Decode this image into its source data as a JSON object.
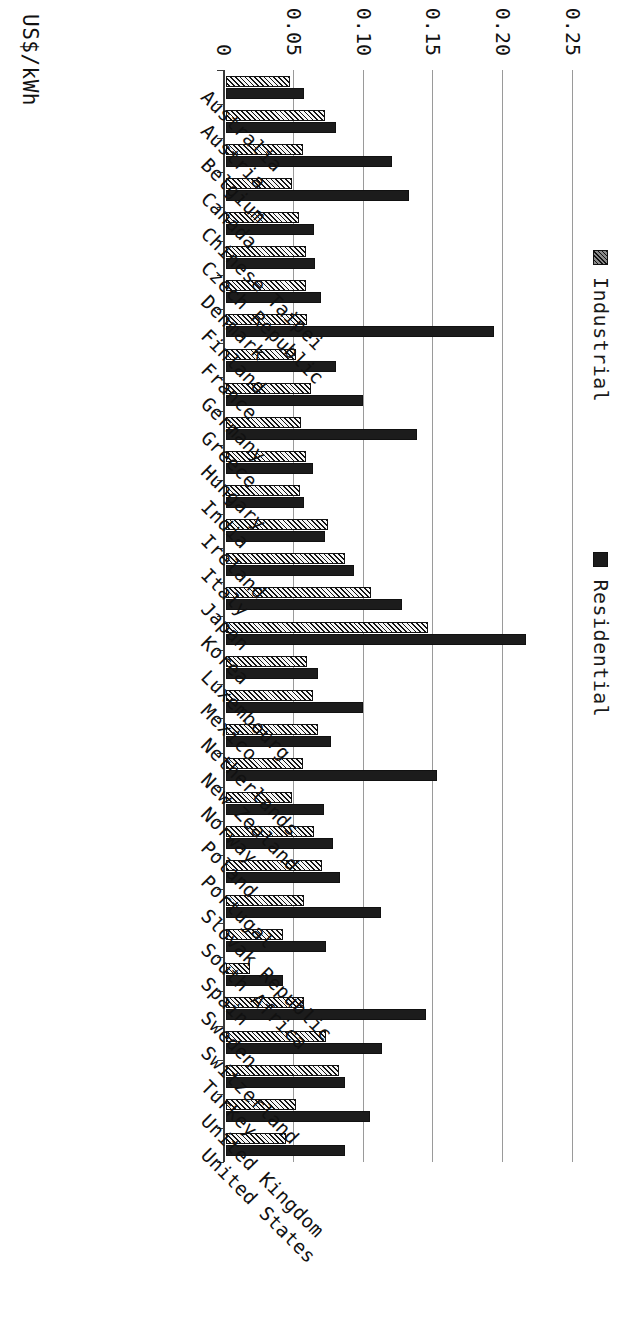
{
  "chart_data": {
    "type": "bar",
    "title": "",
    "subtitle": "",
    "orientation": "vertical-bars-rotated-90",
    "xlabel": "",
    "ylabel": "US$/kWh",
    "ylim": [
      0,
      0.25
    ],
    "yticks": [
      "0",
      "0.05",
      "0.10",
      "0.15",
      "0.20",
      "0.25"
    ],
    "ytick_values": [
      0,
      0.05,
      0.1,
      0.15,
      0.2,
      0.25
    ],
    "grid": true,
    "legend_position": "top",
    "categories": [
      "Australia",
      "Austria",
      "Belgium",
      "Canada",
      "Chinese Taipei",
      "Czech Republic",
      "Denmark",
      "Finland",
      "France",
      "Germany",
      "Greece",
      "Hungary",
      "India",
      "Ireland",
      "Italy",
      "Japan",
      "Korea",
      "Luxembourg",
      "Mexico",
      "Netherlands",
      "New Zealand",
      "Norway",
      "Poland",
      "Portugal",
      "Slovak Republic",
      "South Africa",
      "Spain",
      "Sweden",
      "Switzerland",
      "Turkey",
      "United Kingdom",
      "United States"
    ],
    "series": [
      {
        "name": "Industrial",
        "pattern": "hatched",
        "color": "#8f8f8f",
        "values": [
          0.046,
          0.071,
          0.055,
          0.047,
          0.052,
          0.057,
          0.057,
          0.058,
          0.05,
          0.061,
          0.054,
          0.057,
          0.053,
          0.073,
          0.085,
          0.104,
          0.145,
          0.058,
          0.062,
          0.066,
          0.055,
          0.047,
          0.063,
          0.069,
          0.056,
          0.041,
          0.017,
          0.056,
          0.072,
          0.081,
          0.05,
          0.043
        ]
      },
      {
        "name": "Residential",
        "pattern": "solid",
        "color": "#1c1c1c",
        "values": [
          0.056,
          0.079,
          0.119,
          0.131,
          0.063,
          0.064,
          0.068,
          0.192,
          0.079,
          0.098,
          0.137,
          0.062,
          0.056,
          0.071,
          0.092,
          0.126,
          0.215,
          0.066,
          0.098,
          0.075,
          0.151,
          0.07,
          0.077,
          0.082,
          0.111,
          0.072,
          0.041,
          0.143,
          0.112,
          0.085,
          0.103,
          0.085
        ]
      }
    ]
  },
  "legend": {
    "items": [
      {
        "label": "Industrial",
        "swatch": "hatched-swatch"
      },
      {
        "label": "Residential",
        "swatch": "solid-swatch"
      }
    ]
  },
  "axis": {
    "value_axis_label": "US$/kWh",
    "tick_labels": [
      "0.25",
      "0.20",
      "0.15",
      "0.10",
      "0.05",
      "0"
    ]
  },
  "colors": {
    "residential": "#1c1c1c",
    "industrial": "#8f8f8f",
    "gridline": "#9a9a9a",
    "axis": "#3a3a3a",
    "background": "#ffffff"
  }
}
